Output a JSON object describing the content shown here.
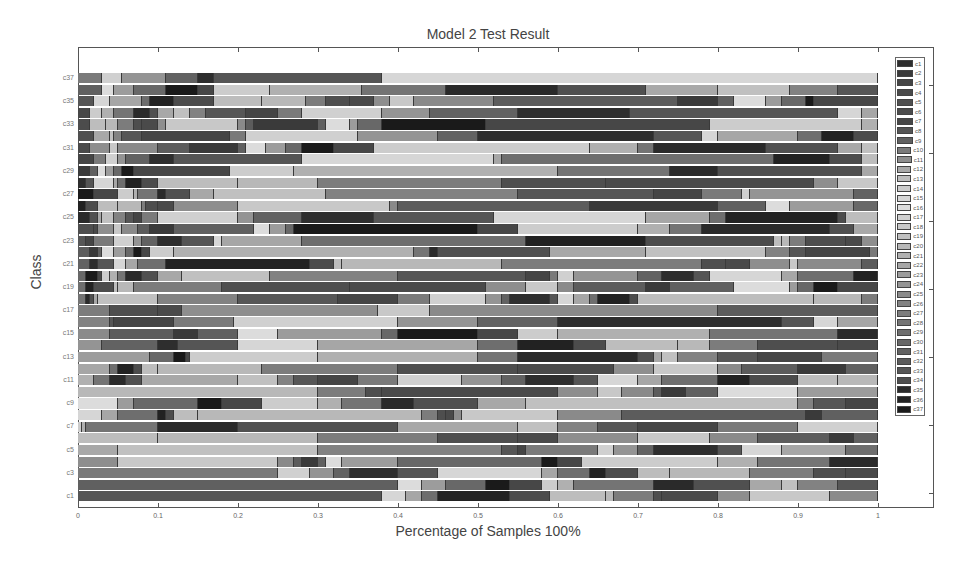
{
  "chart_data": {
    "type": "bar",
    "orientation": "horizontal",
    "stacked": true,
    "title": "Model 2 Test Result",
    "xlabel": "Percentage of Samples 100%",
    "ylabel": "Class",
    "xlim": [
      0,
      1
    ],
    "x_ticks": [
      "0",
      "0.1",
      "0.2",
      "0.3",
      "0.4",
      "0.5",
      "0.6",
      "0.7",
      "0.8",
      "0.9",
      "1"
    ],
    "y_tick_labels": [
      "c1",
      "c3",
      "c5",
      "c7",
      "c9",
      "c11",
      "c13",
      "c15",
      "c17",
      "c19",
      "c21",
      "c23",
      "c25",
      "c27",
      "c29",
      "c31",
      "c33",
      "c35",
      "c37"
    ],
    "categories": [
      "c1",
      "c2",
      "c3",
      "c4",
      "c5",
      "c6",
      "c7",
      "c8",
      "c9",
      "c10",
      "c11",
      "c12",
      "c13",
      "c14",
      "c15",
      "c16",
      "c17",
      "c18",
      "c19",
      "c20",
      "c21",
      "c22",
      "c23",
      "c24",
      "c25",
      "c26",
      "c27",
      "c28",
      "c29",
      "c30",
      "c31",
      "c32",
      "c33",
      "c34",
      "c35",
      "c36",
      "c37"
    ],
    "legend": {
      "position": "right",
      "entries": [
        "c1",
        "c2",
        "c3",
        "c4",
        "c5",
        "c6",
        "c7",
        "c8",
        "c9",
        "c10",
        "c11",
        "c12",
        "c13",
        "c14",
        "c15",
        "c16",
        "c17",
        "c18",
        "c19",
        "c20",
        "c21",
        "c22",
        "c23",
        "c24",
        "c25",
        "c26",
        "c27",
        "c28",
        "c29",
        "c30",
        "c31",
        "c32",
        "c33",
        "c34",
        "c35",
        "c36",
        "c37"
      ],
      "colors": [
        "#2e2e2e",
        "#3a3a3a",
        "#454545",
        "#4a4a4a",
        "#505050",
        "#4c4c4c",
        "#474747",
        "#555555",
        "#606060",
        "#7a7a7a",
        "#8e8e8e",
        "#a8a8a8",
        "#bdbdbd",
        "#cccccc",
        "#d6d6d6",
        "#dcdcdc",
        "#d0d0d0",
        "#c8c8c8",
        "#c0c0c0",
        "#b8b8b8",
        "#b0b0b0",
        "#a6a6a6",
        "#9c9c9c",
        "#949494",
        "#8a8a8a",
        "#828282",
        "#7c7c7c",
        "#747474",
        "#6e6e6e",
        "#686868",
        "#626262",
        "#5c5c5c",
        "#565656",
        "#4e4e4e",
        "#2a2a2a",
        "#222222",
        "#1a1a1a"
      ]
    },
    "grid": false,
    "note": "Each row is a class; stacked segment boundaries (cumulative fraction 0-1) estimated from the image.",
    "series_boundaries": {
      "c37": [
        0.03,
        0.055,
        0.11,
        0.15,
        0.17,
        0.38,
        1.0
      ],
      "c36": [
        0.03,
        0.045,
        0.07,
        0.11,
        0.15,
        0.17,
        0.24,
        0.355,
        0.46,
        0.6,
        0.71,
        0.8,
        0.89,
        0.95,
        1.0
      ],
      "c35": [
        0.02,
        0.04,
        0.08,
        0.09,
        0.12,
        0.17,
        0.23,
        0.285,
        0.31,
        0.34,
        0.37,
        0.39,
        0.42,
        0.52,
        0.75,
        0.8,
        0.82,
        0.86,
        0.88,
        0.91,
        0.92,
        1.0
      ],
      "c34": [
        0.015,
        0.03,
        0.045,
        0.07,
        0.09,
        0.1,
        0.12,
        0.14,
        0.16,
        0.21,
        0.25,
        0.28,
        0.38,
        0.44,
        0.55,
        0.69,
        0.95,
        0.98,
        1.0
      ],
      "c33": [
        0.015,
        0.035,
        0.05,
        0.07,
        0.08,
        0.1,
        0.11,
        0.2,
        0.21,
        0.22,
        0.3,
        0.31,
        0.34,
        0.35,
        0.38,
        0.51,
        0.79,
        0.98,
        1.0
      ],
      "c32": [
        0.02,
        0.04,
        0.045,
        0.055,
        0.08,
        0.19,
        0.21,
        0.35,
        0.45,
        0.5,
        0.72,
        0.78,
        0.8,
        0.9,
        0.93,
        0.97,
        1.0
      ],
      "c31": [
        0.015,
        0.04,
        0.05,
        0.1,
        0.14,
        0.2,
        0.21,
        0.235,
        0.26,
        0.28,
        0.32,
        0.37,
        0.64,
        0.7,
        0.72,
        0.86,
        0.95,
        0.98,
        1.0
      ],
      "c30": [
        0.02,
        0.035,
        0.05,
        0.06,
        0.09,
        0.12,
        0.28,
        0.52,
        0.53,
        0.87,
        0.94,
        0.98,
        1.0
      ],
      "c29": [
        0.015,
        0.025,
        0.035,
        0.045,
        0.055,
        0.07,
        0.19,
        0.27,
        0.6,
        0.74,
        0.8,
        0.98,
        1.0
      ],
      "c28": [
        0.01,
        0.02,
        0.045,
        0.05,
        0.06,
        0.08,
        0.1,
        0.2,
        0.3,
        0.53,
        0.66,
        0.92,
        0.95,
        1.0
      ],
      "c27": [
        0.02,
        0.05,
        0.07,
        0.075,
        0.1,
        0.11,
        0.14,
        0.17,
        0.31,
        0.55,
        0.72,
        0.78,
        0.83,
        0.84,
        0.97,
        1.0
      ],
      "c26": [
        0.01,
        0.025,
        0.05,
        0.08,
        0.085,
        0.1,
        0.12,
        0.2,
        0.39,
        0.4,
        0.64,
        0.8,
        0.86,
        0.89,
        0.97,
        1.0
      ],
      "c25": [
        0.015,
        0.025,
        0.03,
        0.045,
        0.06,
        0.07,
        0.08,
        0.1,
        0.2,
        0.22,
        0.28,
        0.37,
        0.52,
        0.71,
        0.79,
        0.81,
        0.95,
        0.96,
        1.0
      ],
      "c24": [
        0.02,
        0.025,
        0.045,
        0.055,
        0.075,
        0.09,
        0.12,
        0.22,
        0.24,
        0.26,
        0.27,
        0.5,
        0.55,
        0.7,
        0.74,
        0.78,
        0.94,
        0.97,
        1.0
      ],
      "c23": [
        0.01,
        0.02,
        0.045,
        0.07,
        0.08,
        0.1,
        0.13,
        0.17,
        0.18,
        0.28,
        0.56,
        0.71,
        0.87,
        0.88,
        0.89,
        0.91,
        0.96,
        0.98,
        1.0
      ],
      "c22": [
        0.015,
        0.025,
        0.03,
        0.045,
        0.06,
        0.07,
        0.08,
        0.09,
        0.12,
        0.42,
        0.44,
        0.45,
        0.59,
        0.71,
        0.86,
        0.89,
        0.91,
        0.99,
        1.0
      ],
      "c21": [
        0.015,
        0.025,
        0.045,
        0.06,
        0.075,
        0.11,
        0.29,
        0.32,
        0.33,
        0.53,
        0.78,
        0.81,
        0.84,
        0.89,
        0.9,
        0.98,
        1.0
      ],
      "c20": [
        0.01,
        0.025,
        0.03,
        0.04,
        0.05,
        0.06,
        0.08,
        0.1,
        0.13,
        0.24,
        0.4,
        0.56,
        0.59,
        0.6,
        0.62,
        0.7,
        0.73,
        0.77,
        0.79,
        0.88,
        0.9,
        0.97,
        1.0
      ],
      "c19": [
        0.01,
        0.02,
        0.045,
        0.05,
        0.07,
        0.18,
        0.34,
        0.51,
        0.56,
        0.6,
        0.62,
        0.71,
        0.74,
        0.82,
        0.89,
        0.9,
        0.92,
        0.95,
        1.0
      ],
      "c18": [
        0.01,
        0.015,
        0.02,
        0.025,
        0.1,
        0.2,
        0.325,
        0.4,
        0.44,
        0.51,
        0.53,
        0.54,
        0.59,
        0.6,
        0.62,
        0.64,
        0.65,
        0.69,
        0.7,
        0.92,
        0.98,
        1.0
      ],
      "c17": [
        0.04,
        0.1,
        0.13,
        0.375,
        0.44,
        0.8,
        1.0
      ],
      "c16": [
        0.04,
        0.045,
        0.12,
        0.195,
        0.4,
        0.5,
        0.6,
        0.88,
        0.92,
        0.95,
        1.0
      ],
      "c15": [
        0.04,
        0.12,
        0.15,
        0.2,
        0.25,
        0.38,
        0.4,
        0.5,
        0.55,
        0.6,
        0.79,
        0.95,
        1.0
      ],
      "c14": [
        0.03,
        0.1,
        0.125,
        0.2,
        0.3,
        0.5,
        0.55,
        0.62,
        0.66,
        0.75,
        0.79,
        0.85,
        0.95,
        1.0
      ],
      "c13": [
        0.09,
        0.12,
        0.135,
        0.14,
        0.3,
        0.5,
        0.55,
        0.7,
        0.72,
        0.73,
        0.75,
        0.8,
        0.85,
        0.93,
        1.0
      ],
      "c12": [
        0.04,
        0.05,
        0.07,
        0.08,
        0.1,
        0.23,
        0.4,
        0.55,
        0.67,
        0.72,
        0.8,
        0.83,
        0.9,
        0.96,
        1.0
      ],
      "c11": [
        0.02,
        0.04,
        0.06,
        0.08,
        0.2,
        0.25,
        0.27,
        0.3,
        0.35,
        0.4,
        0.48,
        0.53,
        0.56,
        0.62,
        0.65,
        0.7,
        0.73,
        0.8,
        0.84,
        0.9,
        0.95,
        1.0
      ],
      "c10": [
        0.3,
        0.36,
        0.38,
        0.6,
        0.65,
        0.68,
        0.72,
        0.73,
        0.76,
        0.8,
        0.9,
        1.0
      ],
      "c9": [
        0.05,
        0.07,
        0.15,
        0.18,
        0.23,
        0.3,
        0.33,
        0.38,
        0.42,
        0.5,
        0.56,
        0.9,
        0.92,
        0.96,
        1.0
      ],
      "c8": [
        0.03,
        0.05,
        0.1,
        0.11,
        0.12,
        0.15,
        0.43,
        0.45,
        0.46,
        0.47,
        0.48,
        0.6,
        0.68,
        0.91,
        0.93,
        1.0
      ],
      "c7": [
        0.005,
        0.01,
        0.1,
        0.2,
        0.4,
        0.55,
        0.6,
        0.65,
        0.7,
        0.8,
        0.9,
        1.0
      ],
      "c6": [
        0.1,
        0.3,
        0.45,
        0.55,
        0.6,
        0.7,
        0.79,
        0.85,
        0.94,
        0.97,
        1.0
      ],
      "c5": [
        0.05,
        0.3,
        0.53,
        0.55,
        0.56,
        0.65,
        0.67,
        0.7,
        0.72,
        0.8,
        0.83,
        0.88,
        0.96,
        1.0
      ],
      "c4": [
        0.05,
        0.25,
        0.27,
        0.28,
        0.3,
        0.31,
        0.33,
        0.4,
        0.58,
        0.6,
        0.63,
        0.8,
        0.85,
        0.94,
        1.0
      ],
      "c3": [
        0.25,
        0.29,
        0.32,
        0.34,
        0.4,
        0.45,
        0.58,
        0.6,
        0.64,
        0.66,
        0.7,
        0.74,
        0.84,
        0.92,
        0.96,
        1.0
      ],
      "c2": [
        0.4,
        0.43,
        0.46,
        0.51,
        0.54,
        0.58,
        0.6,
        0.62,
        0.72,
        0.77,
        0.84,
        0.88,
        0.9,
        0.95,
        1.0
      ],
      "c1": [
        0.38,
        0.41,
        0.43,
        0.45,
        0.54,
        0.59,
        0.66,
        0.67,
        0.72,
        0.73,
        0.8,
        0.84,
        0.94,
        1.0
      ]
    }
  }
}
